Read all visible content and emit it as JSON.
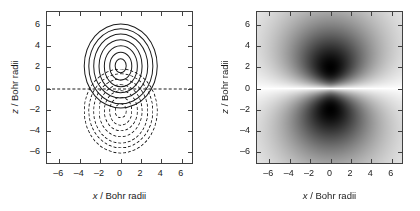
{
  "figure": {
    "panels": [
      {
        "id": "wavefunction-contour",
        "plot_type": "contour",
        "xlabel_var": "x",
        "xlabel_unit": "/ Bohr radii",
        "ylabel_var": "z",
        "ylabel_unit": "/ Bohr radii"
      },
      {
        "id": "probability-density",
        "plot_type": "heatmap",
        "xlabel_var": "x",
        "xlabel_unit": "/ Bohr radii",
        "ylabel_var": "z",
        "ylabel_unit": "/ Bohr radii"
      }
    ]
  },
  "chart_data": [
    {
      "type": "contour",
      "title": "",
      "subtitle": "",
      "xlabel": "x / Bohr radii",
      "ylabel": "z / Bohr radii",
      "xlim": [
        -7.2,
        7.2
      ],
      "ylim": [
        -7.2,
        7.2
      ],
      "xticks": [
        -6,
        -4,
        -2,
        0,
        2,
        4,
        6
      ],
      "yticks": [
        -6,
        -4,
        -2,
        0,
        2,
        4,
        6
      ],
      "xticklabels": [
        "–6",
        "–4",
        "–2",
        "0",
        "2",
        "4",
        "6"
      ],
      "yticklabels": [
        "–6",
        "–4",
        "–2",
        "0",
        "2",
        "4",
        "6"
      ],
      "grid": false,
      "legend": false,
      "annotations": [
        {
          "name": "nodal-plane",
          "kind": "horizontal-dashed-line",
          "z": 0,
          "x_from": -7.2,
          "x_to": 7.2,
          "linestyle": "dashed",
          "color": "#1a1a1a"
        }
      ],
      "series": [
        {
          "name": "positive lobe (solid contours)",
          "sign": "positive",
          "linestyle": "solid",
          "color": "#1a1a1a",
          "center": [
            0,
            2.1
          ],
          "n_contours": 7,
          "contour_radii_x": [
            0.62,
            1.15,
            1.68,
            2.2,
            2.72,
            3.2,
            3.65
          ],
          "contour_radii_z": [
            0.72,
            1.35,
            1.95,
            2.52,
            3.05,
            3.55,
            4.0
          ]
        },
        {
          "name": "negative lobe (dashed contours)",
          "sign": "negative",
          "linestyle": "dashed",
          "color": "#1a1a1a",
          "center": [
            0,
            -2.1
          ],
          "n_contours": 7,
          "contour_radii_x": [
            0.62,
            1.15,
            1.68,
            2.2,
            2.72,
            3.2,
            3.65
          ],
          "contour_radii_z": [
            0.72,
            1.35,
            1.95,
            2.52,
            3.05,
            3.55,
            4.0
          ]
        }
      ]
    },
    {
      "type": "heatmap",
      "title": "",
      "subtitle": "",
      "xlabel": "x / Bohr radii",
      "ylabel": "z / Bohr radii",
      "xlim": [
        -7.2,
        7.2
      ],
      "ylim": [
        -7.2,
        7.2
      ],
      "xticks": [
        -6,
        -4,
        -2,
        0,
        2,
        4,
        6
      ],
      "yticks": [
        -6,
        -4,
        -2,
        0,
        2,
        4,
        6
      ],
      "xticklabels": [
        "–6",
        "–4",
        "–2",
        "0",
        "2",
        "4",
        "6"
      ],
      "yticklabels": [
        "–6",
        "–4",
        "–2",
        "0",
        "2",
        "4",
        "6"
      ],
      "grid": false,
      "legend": false,
      "colormap": "grayscale-inverted",
      "colormap_min_color": "#ffffff",
      "colormap_max_color": "#000000",
      "background_color": "#d9d9d9",
      "features": [
        {
          "name": "upper density lobe",
          "center": [
            0,
            2.1
          ],
          "peak_value": 1.0,
          "radius_x": 2.3,
          "radius_z": 2.5,
          "color": "#000000"
        },
        {
          "name": "lower density lobe",
          "center": [
            0,
            -2.1
          ],
          "peak_value": 1.0,
          "radius_x": 2.3,
          "radius_z": 2.5,
          "color": "#000000"
        },
        {
          "name": "nodal plane",
          "z": 0,
          "value": 0.0,
          "color": "#ffffff"
        }
      ]
    }
  ]
}
